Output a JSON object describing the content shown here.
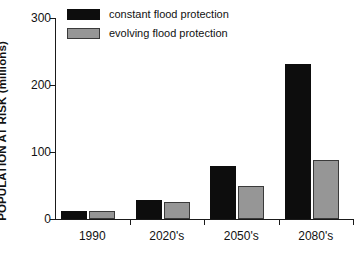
{
  "chart_data": {
    "type": "bar",
    "title": "",
    "xlabel": "",
    "ylabel": "POPULATION AT RISK (millions)",
    "categories": [
      "1990",
      "2020's",
      "2050's",
      "2080's"
    ],
    "series": [
      {
        "name": "constant flood protection",
        "color": "#0d0d0d",
        "values": [
          12,
          28,
          79,
          231
        ]
      },
      {
        "name": "evolving flood protection",
        "color": "#969696",
        "values": [
          12,
          25,
          49,
          88
        ]
      }
    ],
    "ylim": [
      0,
      300
    ],
    "yticks": [
      0,
      100,
      200,
      300
    ],
    "ytick_labels": [
      "0",
      "100",
      "200",
      "300"
    ],
    "grid": false,
    "legend_position": "upper-left-inside"
  },
  "legend": {
    "items": [
      {
        "label": "constant flood protection",
        "swatch": "constant"
      },
      {
        "label": "evolving flood protection",
        "swatch": "evolving"
      }
    ]
  },
  "axes": {
    "y_title": "POPULATION AT RISK (millions)",
    "y_ticks": [
      "0",
      "100",
      "200",
      "300"
    ],
    "x_ticks": [
      "1990",
      "2020's",
      "2050's",
      "2080's"
    ]
  }
}
